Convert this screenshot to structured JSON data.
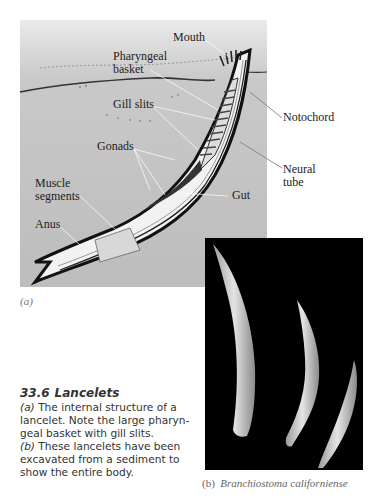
{
  "figure": {
    "panel_a": {
      "sublabel": "(a)",
      "labels": {
        "mouth": "Mouth",
        "pharyngeal_1": "Pharyngeal",
        "pharyngeal_2": "basket",
        "gill_slits": "Gill slits",
        "gonads": "Gonads",
        "muscle_1": "Muscle",
        "muscle_2": "segments",
        "anus": "Anus",
        "notochord": "Notochord",
        "neural_1": "Neural",
        "neural_2": "tube",
        "gut": "Gut"
      }
    },
    "panel_b": {
      "sublabel": "(b)",
      "species": "Branchiostoma californiense"
    },
    "caption": {
      "number": "33.6",
      "title": "Lancelets",
      "lines": [
        {
          "tag": "(a)",
          "text": " The internal structure of a"
        },
        {
          "tag": "",
          "text": "lancelet. Note the large pharyn-"
        },
        {
          "tag": "",
          "text": "geal basket with gill slits."
        },
        {
          "tag": "(b)",
          "text": " These lancelets have been"
        },
        {
          "tag": "",
          "text": "excavated from a sediment to"
        },
        {
          "tag": "",
          "text": "show the entire body."
        }
      ]
    }
  }
}
